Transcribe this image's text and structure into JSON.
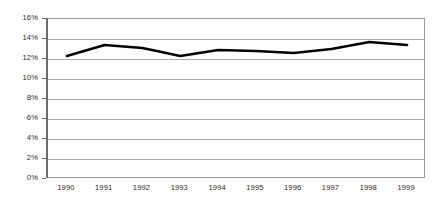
{
  "chart_data": {
    "type": "line",
    "title": "",
    "subtitle": "",
    "xlabel": "",
    "ylabel": "",
    "categories": [
      "1990",
      "1991",
      "1992",
      "1993",
      "1994",
      "1995",
      "1996",
      "1997",
      "1998",
      "1999"
    ],
    "series": [
      {
        "name": "",
        "values": [
          12.3,
          13.4,
          13.1,
          12.3,
          12.9,
          12.8,
          12.6,
          13.0,
          13.7,
          13.4
        ],
        "color": "#000000",
        "line_width": 2.5,
        "markers": false
      }
    ],
    "ylim": [
      0,
      16
    ],
    "ytick_step": 2,
    "ytick_values": [
      0,
      2,
      4,
      6,
      8,
      10,
      12,
      14,
      16
    ],
    "ytick_labels": [
      "0%",
      "2%",
      "4%",
      "6%",
      "8%",
      "10%",
      "12%",
      "14%",
      "16%"
    ],
    "y_unit": "%",
    "grid": {
      "horizontal": true,
      "vertical": false,
      "color": "#a8a8a8"
    },
    "legend": {
      "visible": false,
      "position": "none",
      "entries": []
    },
    "plot_background": "#ffffff",
    "border_color": "#9a9a9a",
    "axis_color": "#6e6e6e",
    "text_color": "#2b2b2b"
  }
}
